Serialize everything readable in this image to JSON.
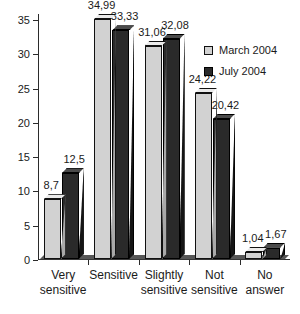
{
  "chart_data": {
    "type": "bar",
    "title": "",
    "xlabel": "",
    "ylabel": "",
    "ylim": [
      0,
      35
    ],
    "grid": false,
    "legend_position": "top-right",
    "categories": [
      "Very sensitive",
      "Sensitive",
      "Slightly sensitive",
      "Not sensitive",
      "No answer"
    ],
    "yticks": [
      "0",
      "5",
      "10",
      "15",
      "20",
      "25",
      "30",
      "35"
    ],
    "ytick_values": [
      0,
      5,
      10,
      15,
      20,
      25,
      30,
      35
    ],
    "series": [
      {
        "name": "March 2004",
        "color": "#d2d2d2",
        "values": [
          8.7,
          34.99,
          31.06,
          24.22,
          1.04
        ],
        "labels": [
          "8,7",
          "34,99",
          "31,06",
          "24,22",
          "1,04"
        ]
      },
      {
        "name": "July 2004",
        "color": "#2a2a2a",
        "values": [
          12.5,
          33.33,
          32.08,
          20.42,
          1.67
        ],
        "labels": [
          "12,5",
          "33,33",
          "32,08",
          "20,42",
          "1,67"
        ]
      }
    ]
  },
  "categories_wrapped": [
    [
      "Very",
      "sensitive"
    ],
    [
      "Sensitive",
      ""
    ],
    [
      "Slightly",
      "sensitive"
    ],
    [
      "Not",
      "sensitive"
    ],
    [
      "No",
      "answer"
    ]
  ],
  "legend": {
    "items": [
      {
        "label": "March 2004",
        "swatch": "light"
      },
      {
        "label": "July 2004",
        "swatch": "dark"
      }
    ]
  }
}
